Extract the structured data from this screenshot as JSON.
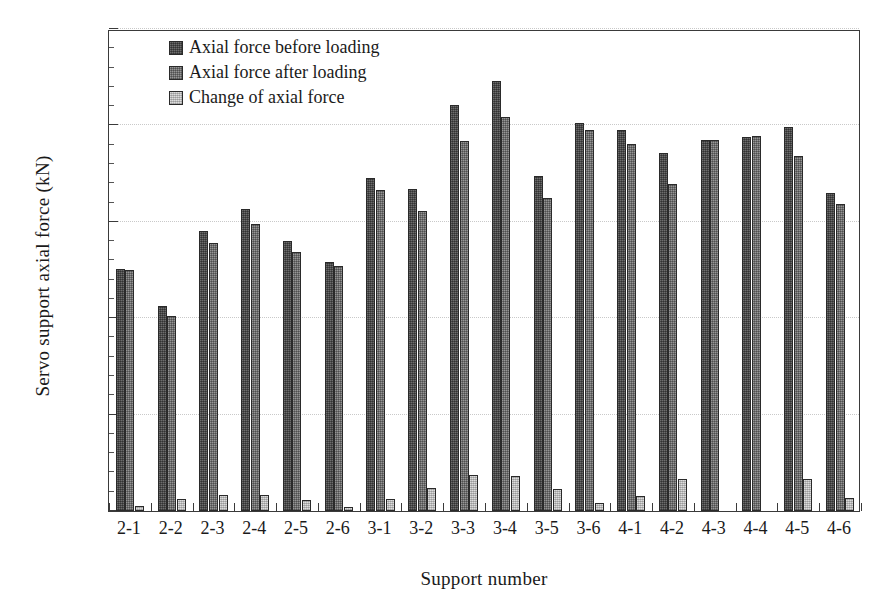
{
  "chart_data": {
    "type": "bar",
    "title": "",
    "xlabel": "Support number",
    "ylabel": "Servo support axial force (kN)",
    "ylim": [
      0,
      2500
    ],
    "yticks": [
      0,
      500,
      1000,
      1500,
      2000,
      2500
    ],
    "ytick_labels": [
      "0",
      "500",
      "1000",
      "1500",
      "2000",
      "2500"
    ],
    "minor_tick_step": 100,
    "grid": "horizontal-dotted",
    "legend_position": "top-left-inside",
    "categories": [
      "2-1",
      "2-2",
      "2-3",
      "2-4",
      "2-5",
      "2-6",
      "3-1",
      "3-2",
      "3-3",
      "3-4",
      "3-5",
      "3-6",
      "4-1",
      "4-2",
      "4-3",
      "4-4",
      "4-5",
      "4-6"
    ],
    "series": [
      {
        "name": "Axial force before loading",
        "color": "#4e4e4e",
        "values": [
          1255,
          1065,
          1450,
          1565,
          1400,
          1290,
          1725,
          1670,
          2105,
          2230,
          1740,
          2010,
          1975,
          1855,
          1925,
          1940,
          1990,
          1650
        ]
      },
      {
        "name": "Axial force after loading",
        "color": "#6e6e6e",
        "values": [
          1250,
          1010,
          1390,
          1490,
          1345,
          1270,
          1665,
          1555,
          1920,
          2045,
          1625,
          1975,
          1905,
          1695,
          1925,
          1945,
          1840,
          1590
        ]
      },
      {
        "name": "Change of axial force",
        "color": "#c2c2c2",
        "values": [
          25,
          60,
          85,
          85,
          55,
          20,
          60,
          120,
          185,
          180,
          115,
          40,
          80,
          165,
          0,
          0,
          165,
          65
        ]
      }
    ]
  },
  "legend": {
    "items": [
      {
        "label": "Axial force before loading",
        "swatch": "#4e4e4e",
        "class": "s0"
      },
      {
        "label": "Axial force after loading",
        "swatch": "#6e6e6e",
        "class": "s1"
      },
      {
        "label": "Change of axial force",
        "swatch": "#c2c2c2",
        "class": "s2"
      }
    ]
  }
}
